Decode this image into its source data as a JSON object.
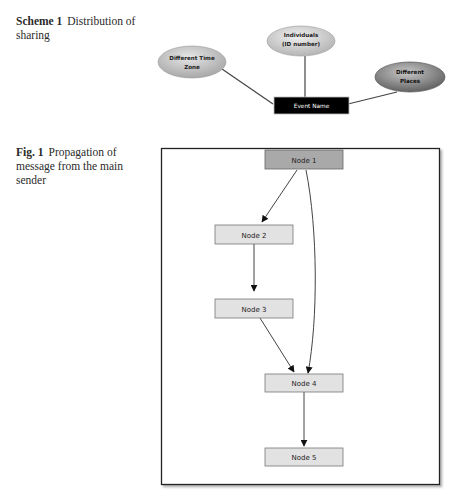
{
  "scheme1": {
    "label": "Scheme 1",
    "caption": "Distribution of sharing",
    "center_node": "Event Name",
    "ellipses": [
      {
        "id": "time-zone",
        "lines": [
          "Different Time",
          "Zone"
        ],
        "fill": "#c4c4c4"
      },
      {
        "id": "individuals",
        "lines": [
          "Individuals",
          "(ID number)"
        ],
        "fill": "#d0d0d0"
      },
      {
        "id": "places",
        "lines": [
          "Different",
          "Places"
        ],
        "fill": "#8e8e8e"
      }
    ],
    "center_fill": "#000000",
    "center_text_color": "#ffffff"
  },
  "fig1": {
    "label": "Fig. 1",
    "caption": "Propagation of message from the main sender",
    "nodes": [
      {
        "id": "node1",
        "label": "Node 1",
        "fill": "#a9a9a9"
      },
      {
        "id": "node2",
        "label": "Node 2",
        "fill": "#e2e2e2"
      },
      {
        "id": "node3",
        "label": "Node 3",
        "fill": "#e2e2e2"
      },
      {
        "id": "node4",
        "label": "Node 4",
        "fill": "#e2e2e2"
      },
      {
        "id": "node5",
        "label": "Node 5",
        "fill": "#e2e2e2"
      }
    ],
    "edges": [
      {
        "from": "Node 1",
        "to": "Node 2"
      },
      {
        "from": "Node 2",
        "to": "Node 3"
      },
      {
        "from": "Node 3",
        "to": "Node 4"
      },
      {
        "from": "Node 1",
        "to": "Node 4"
      },
      {
        "from": "Node 4",
        "to": "Node 5"
      }
    ]
  }
}
